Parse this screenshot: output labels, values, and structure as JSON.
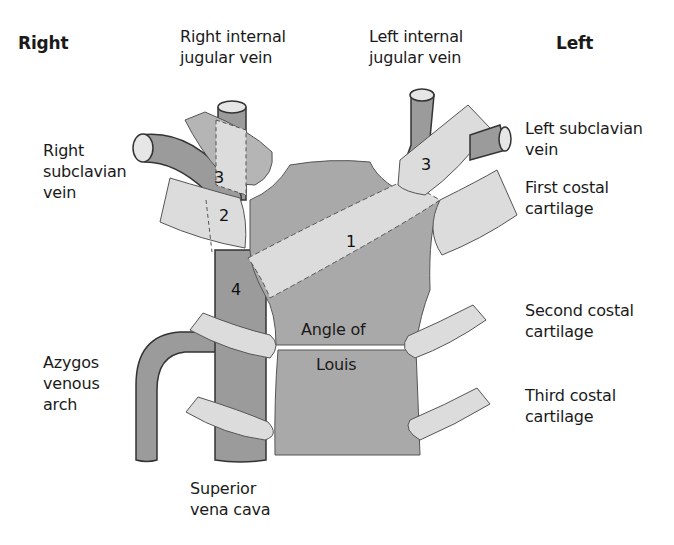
{
  "orientation": {
    "right": "Right",
    "left": "Left"
  },
  "labels": {
    "right_internal_jugular": "Right internal\njugular vein",
    "left_internal_jugular": "Left internal\njugular vein",
    "right_subclavian": "Right\nsubclavian\nvein",
    "left_subclavian": "Left subclavian\nvein",
    "first_costal": "First costal\ncartilage",
    "second_costal": "Second costal\ncartilage",
    "third_costal": "Third costal\ncartilage",
    "azygos": "Azygos\nvenous\narch",
    "svc": "Superior\nvena cava",
    "angle_line1": "Angle of",
    "angle_line2": "Louis"
  },
  "regions": {
    "r1": "1",
    "r2": "2",
    "r3_right": "3",
    "r3_left": "3",
    "r4": "4"
  },
  "colors": {
    "vein": "#9b9b9b",
    "sternum": "#a9a9a9",
    "cartilage": "#dedede",
    "outline": "#4a4a4a"
  }
}
